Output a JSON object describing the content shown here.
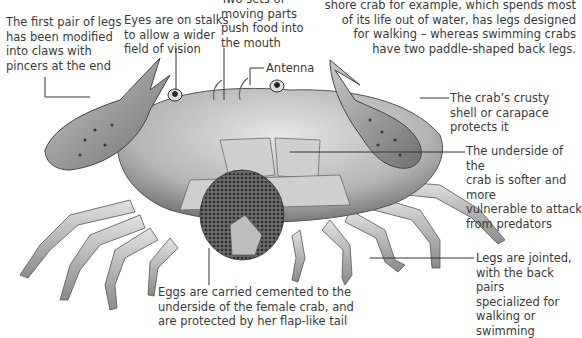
{
  "intro": {
    "text": "shore crab for example, which spends most\nof its life out of water, has legs designed\nfor walking – whereas swimming crabs\nhave two paddle-shaped back legs."
  },
  "labels": {
    "claws": "The first pair of legs\nhas been modified\ninto claws with\npincers at the end",
    "eyes": "Eyes are on stalks\nto allow a wider\nfield of vision",
    "mouthparts": "Two sets of\nmoving parts\npush food into\nthe mouth",
    "antenna": "Antenna",
    "carapace": "The crab’s crusty\nshell or carapace\nprotects it",
    "underside": "The underside of the\ncrab is softer and more\nvulnerable to attack\nfrom predators",
    "legs": "Legs are jointed,\nwith the back pairs\nspecialized for\nwalking or swimming",
    "eggs": "Eggs are carried cemented to the\nunderside of the female crab, and\nare protected by her flap-like tail"
  },
  "colors": {
    "text": "#3a3a3a",
    "leader": "#333333",
    "shell_light": "#d9d9d9",
    "shell_mid": "#a8a8a8",
    "shell_dark": "#5a5a5a",
    "eggs": "#4a4a4a"
  }
}
